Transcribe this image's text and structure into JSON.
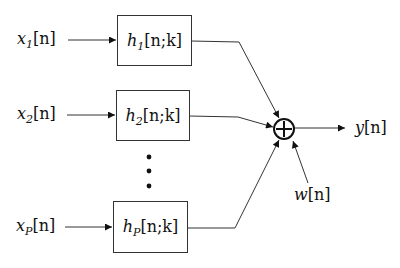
{
  "diagram": {
    "type": "block-diagram",
    "inputs": [
      {
        "id": "x1",
        "var": "x",
        "sub": "1",
        "arg": "[n]"
      },
      {
        "id": "x2",
        "var": "x",
        "sub": "2",
        "arg": "[n]"
      },
      {
        "id": "xp",
        "var": "x",
        "sub": "P",
        "arg": "[n]"
      }
    ],
    "filters": [
      {
        "id": "h1",
        "var": "h",
        "sub": "1",
        "arg": "[n;k]"
      },
      {
        "id": "h2",
        "var": "h",
        "sub": "2",
        "arg": "[n;k]"
      },
      {
        "id": "hp",
        "var": "h",
        "sub": "P",
        "arg": "[n;k]"
      }
    ],
    "ellipsis": "⋮",
    "summer": {
      "symbol": "⊕"
    },
    "noise": {
      "var": "w",
      "arg": "[n]"
    },
    "output": {
      "var": "y",
      "arg": "[n]"
    },
    "colors": {
      "line": "#333333",
      "text": "#111111",
      "background": "#ffffff"
    }
  }
}
